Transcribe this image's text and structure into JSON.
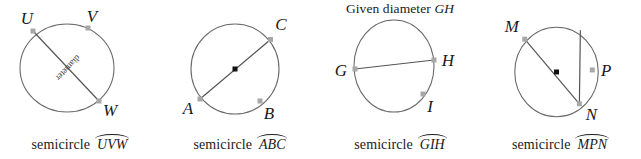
{
  "figure": {
    "background": "#ffffff",
    "stroke_circle": "#6b6b6b",
    "stroke_chord": "#555555",
    "marker_color": "#a8a8a8",
    "center_dot_color": "#111111",
    "text_color": "#1a1a1a"
  },
  "panels": [
    {
      "id": "panel-1",
      "title": "",
      "caption_word": "semicircle",
      "arc_name": "UVW",
      "chord_label": "diameter",
      "has_center_dot": false,
      "points": [
        {
          "label": "U",
          "x": 33,
          "y": 30
        },
        {
          "label": "V",
          "x": 88,
          "y": 28
        },
        {
          "label": "W",
          "x": 99,
          "y": 101
        }
      ]
    },
    {
      "id": "panel-2",
      "title": "",
      "caption_word": "semicircle",
      "arc_name": "ABC",
      "chord_label": "",
      "has_center_dot": true,
      "points": [
        {
          "label": "A",
          "x": 39,
          "y": 99
        },
        {
          "label": "B",
          "x": 100,
          "y": 100
        },
        {
          "label": "C",
          "x": 111,
          "y": 39
        }
      ]
    },
    {
      "id": "panel-3",
      "title_prefix": "Given diameter",
      "title_italic": "GH",
      "caption_word": "semicircle",
      "arc_name": "GIH",
      "chord_label": "",
      "has_center_dot": false,
      "points": [
        {
          "label": "G",
          "x": 35,
          "y": 69
        },
        {
          "label": "H",
          "x": 114,
          "y": 60
        },
        {
          "label": "I",
          "x": 103,
          "y": 94
        }
      ]
    },
    {
      "id": "panel-4",
      "title": "",
      "caption_word": "semicircle",
      "arc_name": "MPN",
      "chord_label": "",
      "has_center_dot": true,
      "points": [
        {
          "label": "M",
          "x": 44,
          "y": 38
        },
        {
          "label": "P",
          "x": 113,
          "y": 70
        },
        {
          "label": "N",
          "x": 100,
          "y": 105
        }
      ]
    }
  ]
}
